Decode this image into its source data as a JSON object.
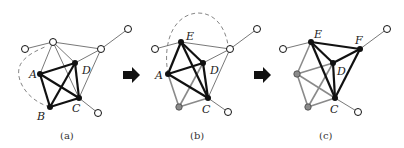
{
  "panels": [
    {
      "caption": "(a)",
      "labels": {
        "A": "A",
        "B": "B",
        "C": "C",
        "D": "D"
      }
    },
    {
      "caption": "(b)",
      "labels": {
        "A": "A",
        "C": "C",
        "D": "D",
        "E": "E"
      }
    },
    {
      "caption": "(c)",
      "labels": {
        "C": "C",
        "D": "D",
        "E": "E",
        "F": "F"
      }
    }
  ],
  "arrows": [
    "right-arrow",
    "right-arrow"
  ],
  "colors": {
    "black": "#111111",
    "gray": "#8a8a8a",
    "thin": "#555555",
    "hollow_fill": "#ffffff"
  }
}
